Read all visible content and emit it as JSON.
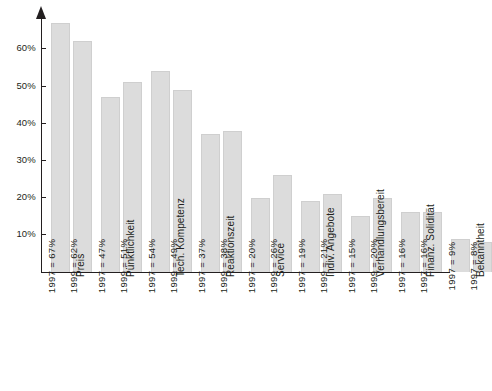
{
  "chart_data": {
    "type": "bar",
    "title": "",
    "xlabel": "",
    "ylabel": "",
    "ylim": [
      0,
      70
    ],
    "grid": false,
    "legend": "none",
    "y_ticks": [
      {
        "value": 60,
        "label": "60%"
      },
      {
        "value": 50,
        "label": "50%"
      },
      {
        "value": 40,
        "label": "40%"
      },
      {
        "value": 30,
        "label": "30%"
      },
      {
        "value": 20,
        "label": "20%"
      },
      {
        "value": 10,
        "label": "10%"
      }
    ],
    "categories": [
      "Preis",
      "Pünktlichkeit",
      "Tech. Kompetenz",
      "Reaktionszeit",
      "Service",
      "Indiv. Angebote",
      "Verhandlungsbereit",
      "Finanz. Solidität",
      "Bekanntheit"
    ],
    "bars": [
      {
        "group": 0,
        "year": "1997",
        "value": 67,
        "label": "1997 = 67%"
      },
      {
        "group": 0,
        "year": "1999",
        "value": 62,
        "label": "1999 = 62%"
      },
      {
        "group": 1,
        "year": "1997",
        "value": 47,
        "label": "1997 = 47%"
      },
      {
        "group": 1,
        "year": "1999",
        "value": 51,
        "label": "1999 = 51%"
      },
      {
        "group": 2,
        "year": "1997",
        "value": 54,
        "label": "1997 = 54%"
      },
      {
        "group": 2,
        "year": "1999",
        "value": 49,
        "label": "1999 = 49%"
      },
      {
        "group": 3,
        "year": "1997",
        "value": 37,
        "label": "1997 = 37%"
      },
      {
        "group": 3,
        "year": "1999",
        "value": 38,
        "label": "1999 = 38%"
      },
      {
        "group": 4,
        "year": "1997",
        "value": 20,
        "label": "1997 = 20%"
      },
      {
        "group": 4,
        "year": "1999",
        "value": 26,
        "label": "1999 = 26%"
      },
      {
        "group": 5,
        "year": "1997",
        "value": 19,
        "label": "1997 = 19%"
      },
      {
        "group": 5,
        "year": "1999",
        "value": 21,
        "label": "1999 = 21%"
      },
      {
        "group": 6,
        "year": "1997",
        "value": 15,
        "label": "1997 = 15%"
      },
      {
        "group": 6,
        "year": "1999",
        "value": 20,
        "label": "1999 = 20%"
      },
      {
        "group": 7,
        "year": "1997",
        "value": 16,
        "label": "1997 = 16%"
      },
      {
        "group": 7,
        "year": "1997",
        "value": 16,
        "label": "1997 = 16%"
      },
      {
        "group": 8,
        "year": "1997",
        "value": 9,
        "label": "1997 = 9%"
      },
      {
        "group": 8,
        "year": "1997",
        "value": 8,
        "label": "1997 = 8%"
      }
    ],
    "series": [
      {
        "name": "1997",
        "values": [
          67,
          47,
          54,
          37,
          20,
          19,
          15,
          16,
          9
        ]
      },
      {
        "name": "1999",
        "values": [
          62,
          51,
          49,
          38,
          26,
          21,
          20,
          16,
          8
        ]
      }
    ],
    "colors": {
      "bar_fill": "#dcdcdc",
      "bar_stroke": "#cfcfcf",
      "axis": "#231f20",
      "text": "#231f20"
    }
  }
}
